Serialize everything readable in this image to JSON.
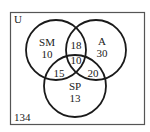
{
  "diagram": {
    "type": "venn3",
    "universe": {
      "label": "U",
      "outside_count": "134"
    },
    "sets": [
      {
        "id": "SM",
        "label": "SM",
        "only_count": "10"
      },
      {
        "id": "A",
        "label": "A",
        "only_count": "30"
      },
      {
        "id": "SP",
        "label": "SP",
        "only_count": "13"
      }
    ],
    "regions": {
      "SM_only": "10",
      "A_only": "30",
      "SP_only": "13",
      "SM_A_only": "18",
      "SM_SP_only": "15",
      "A_SP_only": "20",
      "SM_A_SP": "10",
      "none": "134"
    },
    "colors": {
      "stroke": "#1a1a1a",
      "box": "#555555",
      "background": "#ffffff"
    }
  }
}
